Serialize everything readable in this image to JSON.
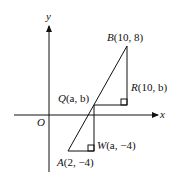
{
  "axes": {
    "x_label": "x",
    "y_label": "y",
    "origin_label": "O"
  },
  "points": {
    "B": {
      "name": "B",
      "coords": "(10, 8)"
    },
    "R": {
      "name": "R",
      "coords": "(10, b)"
    },
    "Q": {
      "name": "Q",
      "coords": "(a, b)"
    },
    "W": {
      "name": "W",
      "coords": "(a, −4)"
    },
    "A": {
      "name": "A",
      "coords": "(2, −4)"
    }
  },
  "colors": {
    "stroke": "#111111",
    "background": "#ffffff"
  }
}
